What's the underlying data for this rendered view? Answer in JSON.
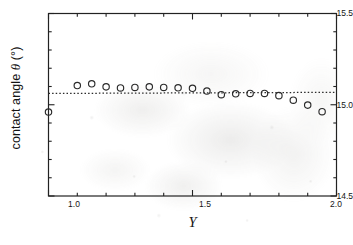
{
  "chart_data": {
    "type": "scatter",
    "title": "",
    "xlabel": "Y",
    "ylabel": "contact angle θ  (°)",
    "ylabel_parts": {
      "prefix": "contact angle ",
      "symbol": "θ",
      "suffix": "  (°)"
    },
    "xlim": [
      1.0,
      2.0
    ],
    "ylim": [
      14.5,
      15.5
    ],
    "xticks": [
      1.0,
      1.5,
      2.0
    ],
    "xtick_labels": [
      "1.0",
      "1.5",
      "2.0"
    ],
    "yticks": [
      14.5,
      15.0,
      15.5
    ],
    "ytick_labels": [
      "14.5",
      "15.0",
      "15.5"
    ],
    "x_minor_step": 0.1,
    "y_minor_step": 0.1,
    "grid": false,
    "legend": null,
    "frame": true,
    "marker": "open-circle",
    "marker_color": "#2b2b2b",
    "series": [
      {
        "name": "contact angle",
        "marker": "open-circle",
        "x": [
          1.0,
          1.1,
          1.15,
          1.2,
          1.25,
          1.3,
          1.35,
          1.4,
          1.45,
          1.5,
          1.55,
          1.6,
          1.65,
          1.7,
          1.75,
          1.8,
          1.85,
          1.9,
          1.95
        ],
        "y": [
          14.96,
          15.105,
          15.115,
          15.098,
          15.092,
          15.095,
          15.098,
          15.095,
          15.093,
          15.09,
          15.075,
          15.055,
          15.06,
          15.062,
          15.062,
          15.05,
          15.025,
          14.998,
          14.962
        ]
      }
    ],
    "reference_line": {
      "type": "dotted-horizontal",
      "label": "",
      "y_start": 15.062,
      "y_end": 15.068,
      "x_start": 1.0,
      "x_end": 2.0,
      "color": "#2b2b2b",
      "style": "dotted"
    },
    "annotations": [],
    "background_note": "faint mottled grayscale scan artifact"
  }
}
